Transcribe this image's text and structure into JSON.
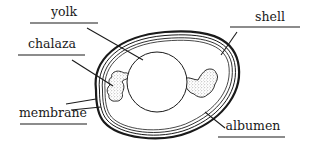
{
  "diagram": {
    "colors": {
      "ink": "#1a1a1a",
      "background": "#ffffff",
      "stipple": "#7a7a7a"
    },
    "labels": {
      "yolk": "yolk",
      "chalaza": "chalaza",
      "shell": "shell",
      "membrane": "membrane",
      "albumen": "albumen"
    }
  }
}
